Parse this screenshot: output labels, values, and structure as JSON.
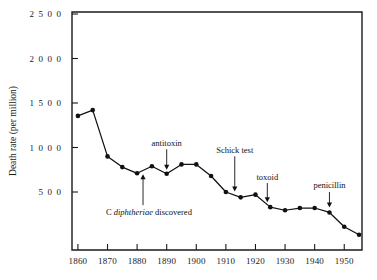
{
  "chart_data": {
    "type": "line",
    "title": "",
    "xlabel": "",
    "ylabel": "Death rate (per million)",
    "xlim": [
      1858,
      1956
    ],
    "ylim": [
      0,
      2500
    ],
    "grid": false,
    "legend": "none",
    "marker": "filled-circle",
    "x_ticks": [
      1860,
      1870,
      1880,
      1890,
      1900,
      1910,
      1920,
      1930,
      1940,
      1950
    ],
    "x_tick_labels": [
      "1860",
      "1870",
      "1880",
      "1890",
      "1900",
      "1910",
      "1920",
      "1930",
      "1940",
      "1950"
    ],
    "y_ticks": [
      500,
      1000,
      1500,
      2000,
      2500
    ],
    "y_tick_labels": [
      "5 0 0",
      "1 0 0 0",
      "1 5 0 0",
      "2 0 0 0",
      "2 5 0 0"
    ],
    "x": [
      1860,
      1865,
      1870,
      1875,
      1880,
      1885,
      1890,
      1895,
      1900,
      1905,
      1910,
      1915,
      1920,
      1925,
      1930,
      1935,
      1940,
      1945,
      1950,
      1955
    ],
    "values": [
      1355,
      1420,
      900,
      780,
      710,
      790,
      705,
      810,
      810,
      680,
      500,
      440,
      470,
      330,
      295,
      320,
      320,
      270,
      110,
      20
    ],
    "series": [
      {
        "name": "Diphtheria death rate",
        "values": [
          1355,
          1420,
          900,
          780,
          710,
          790,
          705,
          810,
          810,
          680,
          500,
          440,
          470,
          330,
          295,
          320,
          320,
          270,
          110,
          20
        ]
      }
    ],
    "annotations": [
      {
        "text": "C diphtheriae discovered",
        "italic_part": "diphtheriae",
        "x": 1882,
        "y": 710,
        "label_x": 1884,
        "label_y": 240
      },
      {
        "text": "antitoxin",
        "x": 1890,
        "y": 705,
        "label_x": 1890,
        "label_y": 1020
      },
      {
        "text": "Schick test",
        "x": 1913,
        "y": 460,
        "label_x": 1913,
        "label_y": 940
      },
      {
        "text": "toxoid",
        "x": 1924,
        "y": 340,
        "label_x": 1924,
        "label_y": 640
      },
      {
        "text": "penicillin",
        "x": 1945,
        "y": 280,
        "label_x": 1945,
        "label_y": 540
      }
    ]
  }
}
